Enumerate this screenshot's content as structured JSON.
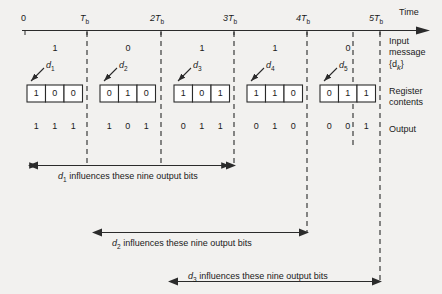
{
  "figure": {
    "type": "timing-diagram"
  },
  "axis": {
    "name": "Time",
    "ticks": [
      {
        "label": "0",
        "sub": ""
      },
      {
        "label": "T",
        "sub": "b"
      },
      {
        "label": "2T",
        "sub": "b"
      },
      {
        "label": "3T",
        "sub": "b"
      },
      {
        "label": "4T",
        "sub": "b"
      },
      {
        "label": "5T",
        "sub": "b"
      }
    ]
  },
  "side_labels": {
    "input_message_line1": "Input",
    "input_message_line2": "message",
    "input_message_line3": "{d",
    "input_message_sub": "k",
    "input_message_line3b": "}",
    "register_line1": "Register",
    "register_line2": "contents",
    "output": "Output"
  },
  "intervals": [
    {
      "input_bit": "1",
      "d_label": "d",
      "d_sub": "1",
      "register": [
        "1",
        "0",
        "0"
      ],
      "output": [
        "1",
        "1",
        "1"
      ]
    },
    {
      "input_bit": "0",
      "d_label": "d",
      "d_sub": "2",
      "register": [
        "0",
        "1",
        "0"
      ],
      "output": [
        "1",
        "0",
        "1"
      ]
    },
    {
      "input_bit": "1",
      "d_label": "d",
      "d_sub": "3",
      "register": [
        "1",
        "0",
        "1"
      ],
      "output": [
        "0",
        "1",
        "1"
      ]
    },
    {
      "input_bit": "1",
      "d_label": "d",
      "d_sub": "4",
      "register": [
        "1",
        "1",
        "0"
      ],
      "output": [
        "0",
        "1",
        "0"
      ]
    },
    {
      "input_bit": "0",
      "d_label": "d",
      "d_sub": "5",
      "register": [
        "0",
        "1",
        "1"
      ],
      "output": [
        "0",
        "0",
        "1"
      ]
    }
  ],
  "spans": [
    {
      "prefix": "d",
      "sub": "1",
      "text": " influences these nine output bits"
    },
    {
      "prefix": "d",
      "sub": "2",
      "text": " influences these nine output bits"
    },
    {
      "prefix": "d",
      "sub": "3",
      "text": " influences these nine output bits"
    }
  ],
  "colors": {
    "background": "#f2f1ef",
    "ink": "#1a1a1a",
    "rule": "#2b2b2b"
  }
}
